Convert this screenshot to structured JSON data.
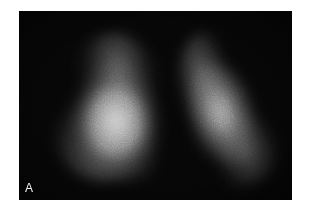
{
  "figure": {
    "panel_label": "A",
    "colors": {
      "background": "#060606",
      "page": "#ffffff",
      "label": "#f2f2f2"
    }
  }
}
